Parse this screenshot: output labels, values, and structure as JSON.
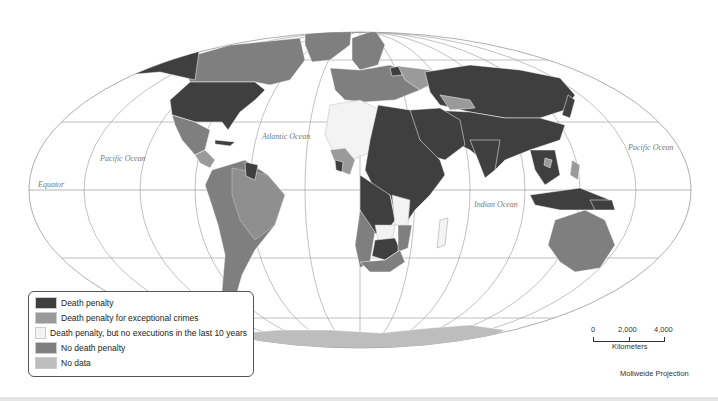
{
  "colors": {
    "death_penalty": "#3f3f3f",
    "exceptional_crimes": "#9a9a9a",
    "no_executions_10y": "#f3f3f3",
    "no_death_penalty": "#7f7f7f",
    "no_data": "#bdbdbd",
    "ocean": "#ffffff",
    "graticule": "#8a8a8a"
  },
  "map": {
    "ocean_labels": [
      {
        "text": "Pacific Ocean",
        "id": "pacific-west"
      },
      {
        "text": "Atlantic Ocean",
        "id": "atlantic"
      },
      {
        "text": "Indian Ocean",
        "id": "indian"
      },
      {
        "text": "Pacific Ocean",
        "id": "pacific-east"
      }
    ],
    "equator_label": "Equator"
  },
  "legend": {
    "items": [
      {
        "label": "Death penalty",
        "color": "#3f3f3f"
      },
      {
        "label": "Death penalty for exceptional crimes",
        "color": "#9a9a9a"
      },
      {
        "label": "Death penalty, but no executions in the last 10 years",
        "color": "#f3f3f3"
      },
      {
        "label": "No death penalty",
        "color": "#7f7f7f"
      },
      {
        "label": "No data",
        "color": "#bdbdbd"
      }
    ]
  },
  "scale": {
    "ticks": [
      "0",
      "2,000",
      "4,000"
    ],
    "unit": "Kilometers"
  },
  "projection": "Mollweide Projection"
}
